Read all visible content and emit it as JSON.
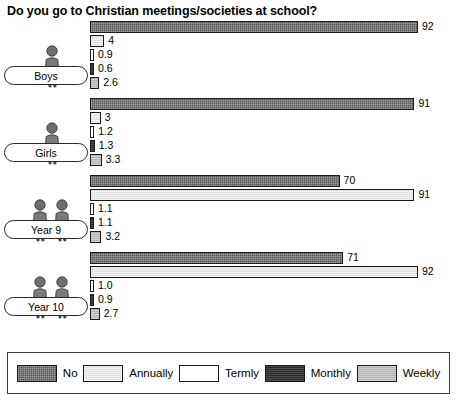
{
  "chart_data": {
    "type": "bar",
    "title": "Do you go to Christian meetings/societies at school?",
    "orientation": "horizontal",
    "xlabel": "",
    "ylabel": "",
    "xlim": [
      0,
      92
    ],
    "grid": false,
    "legend_position": "bottom",
    "categories": [
      "Boys",
      "Girls",
      "Year 9",
      "Year 10"
    ],
    "series": [
      {
        "name": "No",
        "color": "#575757",
        "pattern": "cross-hatch",
        "values": [
          92,
          91,
          70,
          71
        ]
      },
      {
        "name": "Annually",
        "color": "#e2e2e2",
        "pattern": "light-fine",
        "values": [
          4,
          3,
          91,
          92
        ]
      },
      {
        "name": "Termly",
        "color": "#ffffff",
        "pattern": "solid",
        "values": [
          0.9,
          1.2,
          1.1,
          1.0
        ]
      },
      {
        "name": "Monthly",
        "color": "#2b2b2b",
        "pattern": "dark-fine",
        "values": [
          0.6,
          1.3,
          1.1,
          0.9
        ]
      },
      {
        "name": "Weekly",
        "color": "#b6b6b6",
        "pattern": "mid-fine",
        "values": [
          2.6,
          3.3,
          3.2,
          2.7
        ]
      }
    ],
    "value_labels": [
      [
        "92",
        "4",
        "0.9",
        "0.6",
        "2.6"
      ],
      [
        "91",
        "3",
        "1.2",
        "1.3",
        "3.3"
      ],
      [
        "70",
        "91",
        "1.1",
        "1.1",
        "3.2"
      ],
      [
        "71",
        "92",
        "1.0",
        "0.9",
        "2.7"
      ]
    ]
  },
  "legend": {
    "entries": [
      {
        "label": "No"
      },
      {
        "label": "Annually"
      },
      {
        "label": "Termly"
      },
      {
        "label": "Monthly"
      },
      {
        "label": "Weekly"
      }
    ]
  },
  "groups": [
    {
      "label": "Boys",
      "people": 1,
      "icon": "person-icon"
    },
    {
      "label": "Girls",
      "people": 1,
      "icon": "person-icon"
    },
    {
      "label": "Year 9",
      "people": 2,
      "icon": "two-people-icon"
    },
    {
      "label": "Year 10",
      "people": 2,
      "icon": "two-people-icon"
    }
  ]
}
